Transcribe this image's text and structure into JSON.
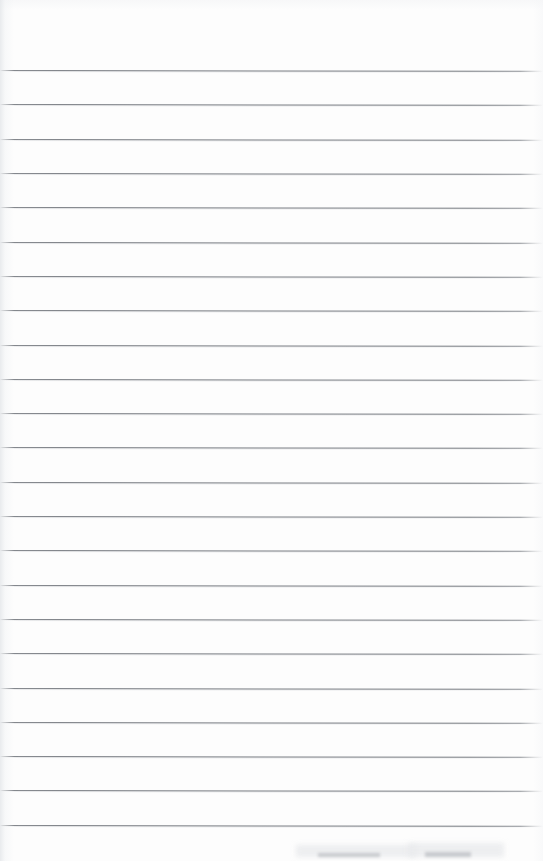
{
  "document": {
    "kind": "scanned-ruled-notebook-page",
    "page_width": 543,
    "page_height": 861,
    "background_color": "#fdfdfd",
    "visible_text": "",
    "note": "Blank lined paper scan; no handwriting, printing, headings, page numbers or other text is rendered anywhere in the image."
  },
  "ruling": {
    "line_color": "#747880",
    "line_count": 23,
    "first_line_y": 70,
    "line_spacing": 34.3,
    "line_thickness": 1,
    "left_start_x": 0,
    "right_end_x": 543,
    "skew_degrees": 0.085,
    "line_y_positions": [
      70,
      104,
      138.6,
      173,
      207.3,
      241.6,
      275.9,
      310.2,
      344.5,
      378.8,
      413.1,
      447.4,
      481.7,
      516,
      550.3,
      584.6,
      618.9,
      653.2,
      687.5,
      721.8,
      756.1,
      790.4,
      824.7
    ]
  },
  "margins": {
    "top_margin_height": 70,
    "bottom_margin_height": 36,
    "left_edge_band_width": 14
  },
  "artifacts": {
    "bottom_smudges": [
      {
        "x": 318,
        "y": 853,
        "width": 62,
        "height": 4
      },
      {
        "x": 425,
        "y": 852,
        "width": 46,
        "height": 5
      }
    ],
    "bottom_soft_haze": [
      {
        "x": 296,
        "y": 845,
        "width": 120,
        "height": 12
      },
      {
        "x": 408,
        "y": 843,
        "width": 96,
        "height": 14
      }
    ]
  }
}
